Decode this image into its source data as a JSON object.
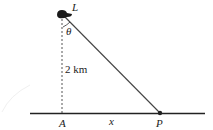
{
  "diagram": {
    "labels": {
      "lighthouse": "L",
      "angle": "θ",
      "distance": "2 km",
      "foot": "A",
      "horizontal": "x",
      "point": "P"
    },
    "colors": {
      "line": "#333333",
      "ground": "#222222",
      "blob": "#1a1a1a"
    }
  }
}
